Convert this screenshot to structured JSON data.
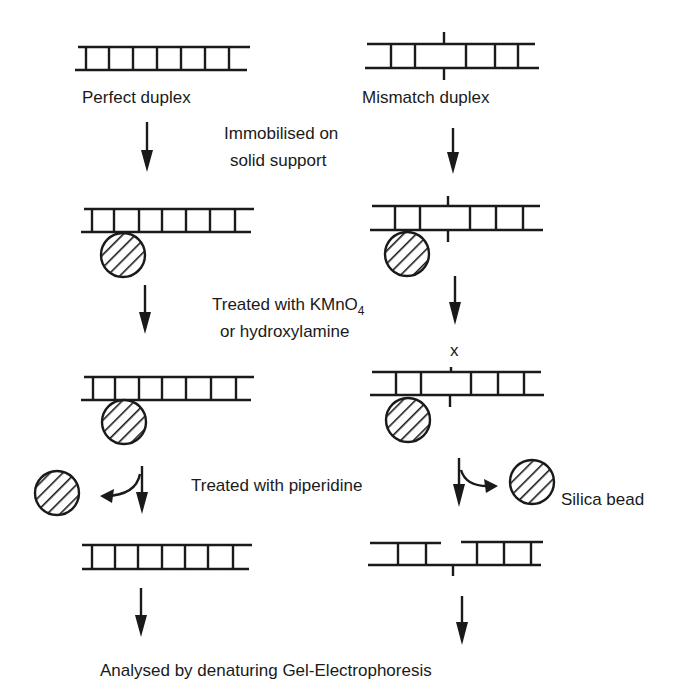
{
  "diagram": {
    "columns": {
      "left": {
        "start_label": "Perfect duplex"
      },
      "right": {
        "start_label": "Mismatch duplex"
      }
    },
    "steps": [
      {
        "line1": "Immobilised on",
        "line2": "solid support"
      },
      {
        "line1": "Treated with KMnO",
        "subscript": "4",
        "line2": "or hydroxylamine"
      },
      {
        "line1": "Treated with piperidine"
      }
    ],
    "mismatch_mark": "x",
    "bead_label": "Silica bead",
    "final_label": "Analysed by denaturing Gel-Electrophoresis",
    "colors": {
      "ink": "#1a1a1a",
      "background": "#ffffff"
    }
  }
}
